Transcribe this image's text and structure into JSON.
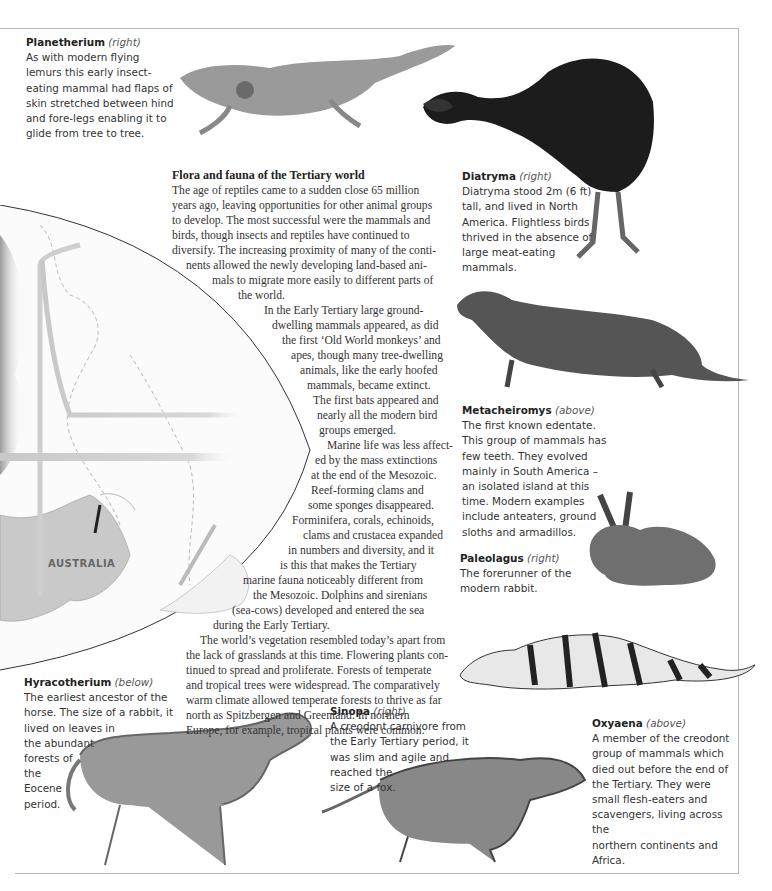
{
  "page": {
    "frame_color": "#b8b8b8",
    "text_color": "#333333"
  },
  "article": {
    "title": "Flora and fauna of the Tertiary world",
    "lines": [
      "The age of reptiles came to a sudden close 65 million",
      "years ago, leaving opportunities for other animal groups",
      "to develop. The most successful were the mammals and",
      "birds, though insects and reptiles have continued to",
      "diversify. The increasing proximity of many of the conti-",
      "nents allowed the newly developing land-based ani-",
      "mals to migrate more easily to different parts of",
      "the world.",
      "In the Early Tertiary large ground-",
      "dwelling mammals appeared, as did",
      "the first ‘Old World monkeys’ and",
      "apes, though many tree-dwelling",
      "animals, like the early hoofed",
      "mammals, became extinct.",
      "The first bats appeared and",
      "nearly all the modern bird",
      "groups emerged.",
      "Marine life was less affect-",
      "ed by the mass extinctions",
      "at the end of the Mesozoic.",
      "Reef-forming clams and",
      "some sponges disappeared.",
      "Forminifera, corals, echinoids,",
      "clams and crustacea expanded",
      "in numbers and diversity, and it",
      "is this that makes the Tertiary",
      "marine fauna noticeably different from",
      "the Mesozoic. Dolphins and sirenians",
      "(sea-cows) developed and entered the sea",
      "during the Early Tertiary.",
      "The world’s vegetation resembled today’s apart from",
      "the lack of grasslands at this time. Flowering plants con-",
      "tinued to spread and proliferate. Forests of temperate",
      "and tropical trees were widespread. The comparatively",
      "warm climate allowed temperate forests to thrive as far",
      "north as Spitzbergen and Greenland. In northern",
      "Europe, for example, tropical plants were common."
    ]
  },
  "map": {
    "label": "AUSTRALIA"
  },
  "captions": {
    "planetherium": {
      "name": "Planetherium",
      "direction": "(right)",
      "lines": [
        "As with modern flying",
        "lemurs this early insect-",
        "eating mammal had flaps of",
        "skin stretched between hind",
        "and fore-legs enabling it to",
        "glide from tree to tree."
      ]
    },
    "diatryma": {
      "name": "Diatryma",
      "direction": "(right)",
      "lines": [
        "Diatryma stood 2m (6 ft)",
        "tall, and lived in North",
        "America. Flightless birds",
        "thrived in the absence of",
        "large meat-eating",
        "mammals."
      ]
    },
    "metacheiromys": {
      "name": "Metacheiromys",
      "direction": "(above)",
      "lines": [
        "The first known edentate.",
        "This group of mammals has",
        "few teeth. They evolved",
        "mainly in South America –",
        "an isolated island at this",
        "time. Modern examples",
        "include anteaters, ground",
        "sloths and armadillos."
      ]
    },
    "paleolagus": {
      "name": "Paleolagus",
      "direction": "(right)",
      "lines": [
        "The forerunner of the",
        "modern rabbit."
      ]
    },
    "hyracotherium": {
      "name": "Hyracotherium",
      "direction": "(below)",
      "lines": [
        "The earliest ancestor of the",
        "horse. The size of a rabbit, it",
        "lived on leaves in",
        "the abundant",
        "forests of",
        "the",
        "Eocene",
        "period."
      ]
    },
    "sinopa": {
      "name": "Sinopa",
      "direction": "(right)",
      "lines": [
        "A creodont carnivore from",
        "the Early Tertiary period, it",
        "was slim and agile and",
        "reached the",
        "size of a fox."
      ]
    },
    "oxyaena": {
      "name": "Oxyaena",
      "direction": "(above)",
      "lines": [
        "A member of the creodont",
        "group of mammals which",
        "died out before the end of",
        "the Tertiary. They were",
        "small flesh-eaters and",
        "scavengers, living across the",
        "northern continents and",
        "Africa."
      ]
    }
  }
}
